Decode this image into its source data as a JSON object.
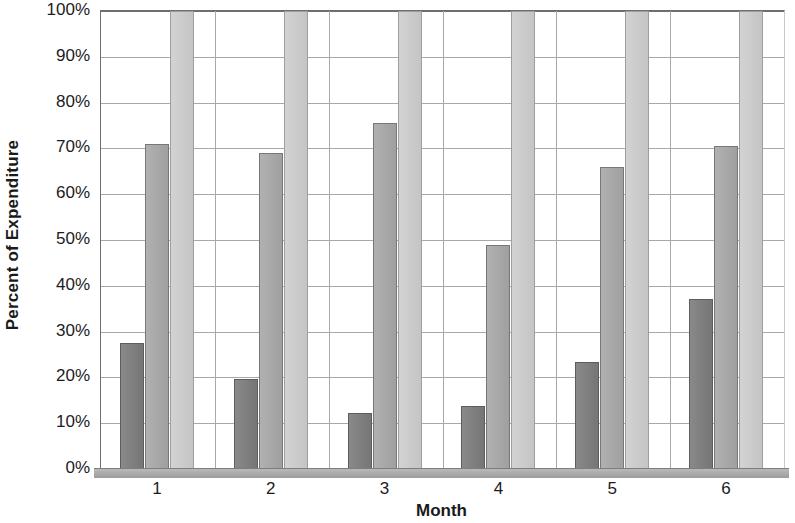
{
  "chart_data": {
    "type": "bar",
    "title": "",
    "subtitle": "",
    "xlabel": "Month",
    "ylabel": "Percent of Expenditure",
    "categories": [
      "1",
      "2",
      "3",
      "4",
      "5",
      "6"
    ],
    "series": [
      {
        "name": "series-1",
        "color": "#7c7c7c",
        "values": [
          27.5,
          19.7,
          12.3,
          13.7,
          23.3,
          37.2
        ]
      },
      {
        "name": "series-2",
        "color": "#a6a6a6",
        "values": [
          71.0,
          69.0,
          75.5,
          49.0,
          66.0,
          70.5
        ]
      },
      {
        "name": "series-3",
        "color": "#cbcbcb",
        "values": [
          100.0,
          100.0,
          100.0,
          100.0,
          100.0,
          100.0
        ]
      }
    ],
    "ylim": [
      0,
      100
    ],
    "y_ticks": [
      0,
      10,
      20,
      30,
      40,
      50,
      60,
      70,
      80,
      90,
      100
    ],
    "y_tick_labels": [
      "0%",
      "10%",
      "20%",
      "30%",
      "40%",
      "50%",
      "60%",
      "70%",
      "80%",
      "90%",
      "100%"
    ],
    "grid": "horizontal-and-vertical",
    "legend": "none",
    "bar_grouping": "clustered",
    "orientation": "vertical",
    "background_color": "#ffffff",
    "gridline_color": "#a8a8a8",
    "axis_color": "#6e6e6e",
    "text_color": "#1c1c1c"
  }
}
